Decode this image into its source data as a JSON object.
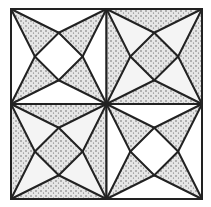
{
  "figure": {
    "type": "geometric-quilt-pattern",
    "colors": {
      "background": "#ffffff",
      "line": "#222222",
      "stipple_fill": "#e4e4e4",
      "stipple_dot": "#5a5a5a"
    },
    "outer_square": {
      "x1": 11,
      "y1": 9,
      "x2": 202,
      "y2": 199
    },
    "quadrants": [
      {
        "position": "top-left",
        "star_points_shaded": true
      },
      {
        "position": "top-right",
        "star_points_shaded": false
      },
      {
        "position": "bottom-left",
        "star_points_shaded": false
      },
      {
        "position": "bottom-right",
        "star_points_shaded": true
      }
    ]
  }
}
